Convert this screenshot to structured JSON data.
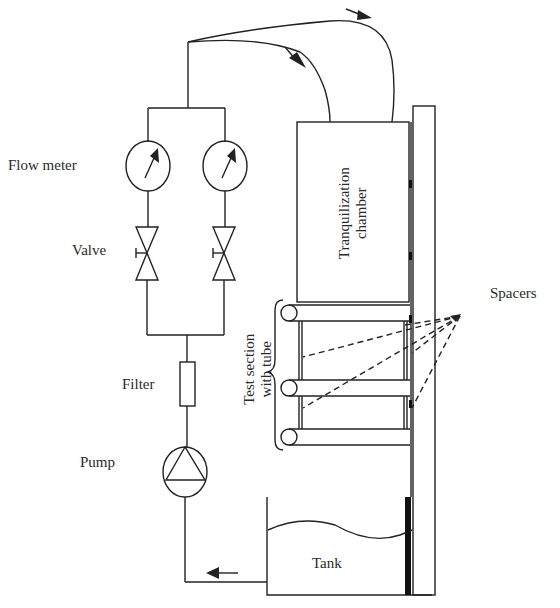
{
  "diagram": {
    "type": "experimental-flow-loop-schematic",
    "labels": {
      "flow_meter": "Flow meter",
      "valve": "Valve",
      "filter": "Filter",
      "pump": "Pump",
      "tank": "Tank",
      "spacers": "Spacers",
      "chamber_line1": "Tranquilization",
      "chamber_line2": "chamber",
      "test_section_line1": "Test section",
      "test_section_line2": "with tube"
    },
    "components": [
      {
        "id": "flow-meter-left",
        "kind": "flow meter"
      },
      {
        "id": "flow-meter-right",
        "kind": "flow meter"
      },
      {
        "id": "valve-left",
        "kind": "valve"
      },
      {
        "id": "valve-right",
        "kind": "valve"
      },
      {
        "id": "filter",
        "kind": "filter"
      },
      {
        "id": "pump",
        "kind": "pump"
      },
      {
        "id": "tank",
        "kind": "tank"
      },
      {
        "id": "tranquilization-chamber",
        "kind": "chamber"
      },
      {
        "id": "test-section",
        "kind": "tube bundle",
        "tube_count": 3
      },
      {
        "id": "spacers",
        "kind": "spacer",
        "count": 4
      }
    ],
    "flow_arrows": 3,
    "colors": {
      "line": "#222222",
      "background": "#ffffff"
    }
  }
}
